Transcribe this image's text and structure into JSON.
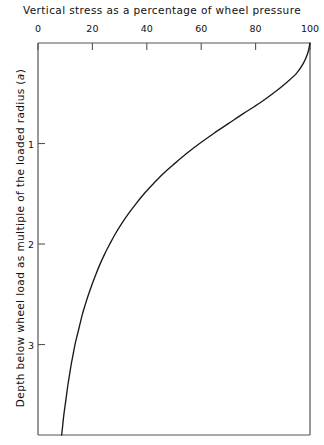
{
  "chart_data": {
    "type": "line",
    "title": "",
    "xlabel": "Vertical stress as a percentage of wheel pressure",
    "ylabel": "Depth below wheel load as multiple of the loaded radius (a)",
    "ylabel_plain": "Depth below wheel load as multiple of the loaded radius",
    "ylabel_italic_symbol": "a",
    "xlim": [
      0,
      100
    ],
    "ylim": [
      0,
      3.9
    ],
    "x_axis_position": "top",
    "y_axis_direction": "downward",
    "grid": false,
    "legend": null,
    "xticks": [
      0,
      20,
      40,
      60,
      80,
      100
    ],
    "xtick_labels": [
      "0",
      "20",
      "40",
      "60",
      "80",
      "100"
    ],
    "yticks": [
      1,
      2,
      3
    ],
    "ytick_labels": [
      "1",
      "2",
      "3"
    ],
    "series": [
      {
        "name": "Vertical stress beneath centre of circular loaded area",
        "x_label": "stress_percent",
        "y_label": "depth_multiples_of_a",
        "points": [
          [
            100.0,
            0.0
          ],
          [
            99.2,
            0.1
          ],
          [
            97.6,
            0.2
          ],
          [
            95.1,
            0.3
          ],
          [
            91.1,
            0.4
          ],
          [
            86.5,
            0.5
          ],
          [
            81.4,
            0.6
          ],
          [
            75.6,
            0.7
          ],
          [
            70.1,
            0.8
          ],
          [
            64.6,
            0.9
          ],
          [
            59.4,
            1.0
          ],
          [
            54.6,
            1.1
          ],
          [
            50.2,
            1.2
          ],
          [
            46.0,
            1.3
          ],
          [
            42.4,
            1.4
          ],
          [
            39.0,
            1.5
          ],
          [
            36.0,
            1.6
          ],
          [
            33.2,
            1.7
          ],
          [
            30.7,
            1.8
          ],
          [
            28.4,
            1.9
          ],
          [
            26.4,
            2.0
          ],
          [
            24.5,
            2.1
          ],
          [
            22.8,
            2.2
          ],
          [
            21.3,
            2.3
          ],
          [
            19.9,
            2.4
          ],
          [
            18.6,
            2.5
          ],
          [
            17.4,
            2.6
          ],
          [
            16.3,
            2.7
          ],
          [
            15.4,
            2.8
          ],
          [
            14.5,
            2.9
          ],
          [
            13.6,
            3.0
          ],
          [
            12.9,
            3.1
          ],
          [
            12.2,
            3.2
          ],
          [
            11.6,
            3.3
          ],
          [
            11.0,
            3.4
          ],
          [
            10.5,
            3.5
          ],
          [
            10.0,
            3.6
          ],
          [
            9.5,
            3.7
          ],
          [
            9.1,
            3.8
          ],
          [
            8.7,
            3.9
          ]
        ]
      }
    ],
    "colors": {
      "line": "#1a1a1a",
      "axis": "#555555",
      "text": "#111111",
      "background": "#ffffff"
    }
  },
  "axes": {
    "x_title": "Vertical stress as a percentage of wheel pressure",
    "y_title_prefix": "Depth below wheel load as multiple of the loaded radius (",
    "y_title_symbol": "a",
    "y_title_suffix": ")"
  }
}
